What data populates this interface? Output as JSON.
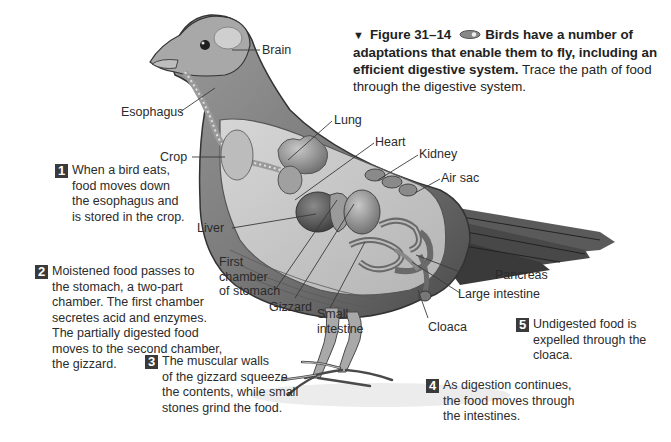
{
  "caption": {
    "marker": "▼",
    "figure_label": "Figure 31–14",
    "icon": "eye-icon",
    "bold_text": "Birds have a number of adaptations that enable them to fly, including an efficient digestive system.",
    "line1_bold": "Birds have a number of",
    "line2_bold": "adaptations that enable them to fly, including an",
    "line3_bold": "efficient digestive system.",
    "line3_rest": " Trace the path of food",
    "line4": "through the digestive system."
  },
  "labels": {
    "brain": "Brain",
    "esophagus": "Esophagus",
    "lung": "Lung",
    "heart": "Heart",
    "kidney": "Kidney",
    "crop": "Crop",
    "air_sac": "Air sac",
    "liver": "Liver",
    "first_chamber": "First\nchamber\nof stomach",
    "gizzard": "Gizzard",
    "small_intestine": "Small\nintestine",
    "pancreas": "Pancreas",
    "large_intestine": "Large intestine",
    "cloaca": "Cloaca"
  },
  "steps": [
    {
      "number": "1",
      "text": "When a bird eats,\nfood moves down\nthe esophagus and\nis stored in the crop."
    },
    {
      "number": "2",
      "text": "Moistened food passes to\nthe stomach, a two-part\nchamber. The first chamber\nsecretes acid and enzymes.\nThe partially digested food\nmoves to the second chamber,\nthe gizzard."
    },
    {
      "number": "3",
      "text": "The muscular walls\nof the gizzard squeeze\nthe contents, while small\nstones grind the food."
    },
    {
      "number": "4",
      "text": "As digestion continues,\nthe food moves through\nthe intestines."
    },
    {
      "number": "5",
      "text": "Undigested food is\nexpelled through the\ncloaca."
    }
  ],
  "colors": {
    "text": "#2b2b2b",
    "badge_bg": "#3a3a3a",
    "illustration": "grayscale"
  }
}
